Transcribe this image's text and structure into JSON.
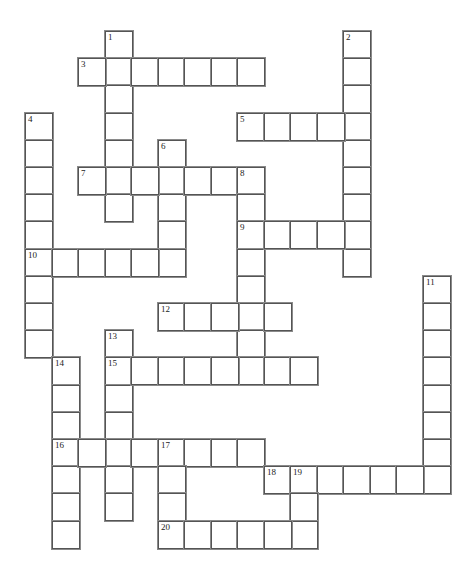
{
  "puzzle": {
    "type": "crossword",
    "grid": {
      "cols": 16,
      "rows": 19,
      "origin_x": 25,
      "origin_y": 31,
      "cell_w": 26.5,
      "cell_h": 27.2
    },
    "colors": {
      "background": "#ffffff",
      "cell_fill": "#ffffff",
      "cell_border": "#555555",
      "outer_border": "#8a8a8a",
      "number_text": "#222222"
    },
    "entries": [
      {
        "number": "1",
        "direction": "down",
        "row": 0,
        "col": 3,
        "length": 7,
        "answer": ""
      },
      {
        "number": "2",
        "direction": "down",
        "row": 0,
        "col": 12,
        "length": 9,
        "answer": ""
      },
      {
        "number": "3",
        "direction": "across",
        "row": 1,
        "col": 2,
        "length": 7,
        "answer": ""
      },
      {
        "number": "4",
        "direction": "down",
        "row": 3,
        "col": 0,
        "length": 9,
        "answer": ""
      },
      {
        "number": "5",
        "direction": "across",
        "row": 3,
        "col": 8,
        "length": 5,
        "answer": ""
      },
      {
        "number": "6",
        "direction": "down",
        "row": 4,
        "col": 5,
        "length": 5,
        "answer": ""
      },
      {
        "number": "7",
        "direction": "across",
        "row": 5,
        "col": 2,
        "length": 7,
        "answer": ""
      },
      {
        "number": "8",
        "direction": "down",
        "row": 5,
        "col": 8,
        "length": 8,
        "answer": ""
      },
      {
        "number": "9",
        "direction": "across",
        "row": 7,
        "col": 8,
        "length": 5,
        "answer": ""
      },
      {
        "number": "10",
        "direction": "across",
        "row": 8,
        "col": 0,
        "length": 6,
        "answer": ""
      },
      {
        "number": "11",
        "direction": "down",
        "row": 9,
        "col": 15,
        "length": 8,
        "answer": ""
      },
      {
        "number": "12",
        "direction": "across",
        "row": 10,
        "col": 5,
        "length": 5,
        "answer": ""
      },
      {
        "number": "13",
        "direction": "down",
        "row": 11,
        "col": 3,
        "length": 7,
        "answer": ""
      },
      {
        "number": "14",
        "direction": "down",
        "row": 12,
        "col": 1,
        "length": 7,
        "answer": ""
      },
      {
        "number": "15",
        "direction": "across",
        "row": 12,
        "col": 3,
        "length": 8,
        "answer": ""
      },
      {
        "number": "16",
        "direction": "across",
        "row": 15,
        "col": 1,
        "length": 8,
        "answer": ""
      },
      {
        "number": "17",
        "direction": "down",
        "row": 15,
        "col": 5,
        "length": 4,
        "answer": ""
      },
      {
        "number": "18",
        "direction": "across",
        "row": 16,
        "col": 9,
        "length": 7,
        "answer": ""
      },
      {
        "number": "19",
        "direction": "down",
        "row": 16,
        "col": 10,
        "length": 3,
        "answer": ""
      },
      {
        "number": "20",
        "direction": "across",
        "row": 18,
        "col": 5,
        "length": 6,
        "answer": ""
      }
    ]
  }
}
